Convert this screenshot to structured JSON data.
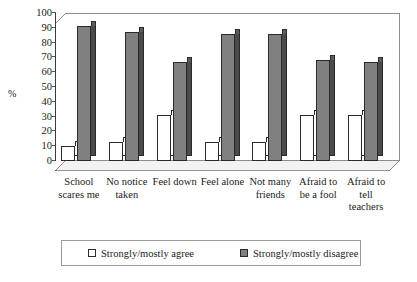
{
  "chart_data": {
    "type": "bar",
    "title": "",
    "xlabel": "",
    "ylabel": "%",
    "ylim": [
      0,
      100
    ],
    "yticks": [
      0,
      10,
      20,
      30,
      40,
      50,
      60,
      70,
      80,
      90,
      100
    ],
    "grid": false,
    "legend_position": "bottom",
    "categories": [
      "School scares me",
      "No notice taken",
      "Feel down",
      "Feel alone",
      "Not many friends",
      "Afraid to be a fool",
      "Afraid to tell teachers"
    ],
    "category_lines": [
      [
        "School",
        "scares me"
      ],
      [
        "No notice",
        "taken"
      ],
      [
        "Feel down"
      ],
      [
        "Feel alone"
      ],
      [
        "Not many",
        "friends"
      ],
      [
        "Afraid to",
        "be a fool"
      ],
      [
        "Afraid to",
        "tell",
        "teachers"
      ]
    ],
    "series": [
      {
        "name": "Strongly/mostly agree",
        "color": "#ffffff",
        "values": [
          10,
          13,
          31,
          13,
          13,
          31,
          31
        ]
      },
      {
        "name": "Strongly/mostly disagree",
        "color": "#808080",
        "values": [
          91,
          87,
          67,
          86,
          86,
          68,
          67
        ]
      }
    ]
  },
  "axis": {
    "y_title": "%"
  }
}
